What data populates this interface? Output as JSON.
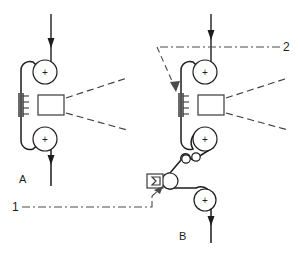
{
  "figure": {
    "width": 300,
    "height": 257,
    "background": "#ffffff",
    "line_color": "#1d1d1d",
    "dash_color": "#4a4a4a",
    "component_color": "#3a3a3a"
  },
  "labels": {
    "station_a": "A",
    "station_b": "B",
    "ref_one": "1",
    "ref_two": "2",
    "roller_mark": "+"
  },
  "stations": [
    {
      "id": "A",
      "label": "A",
      "entry_arrow_direction": "down",
      "exit_arrow_direction": "down",
      "rollers": [
        {
          "name": "upper-driven-roller",
          "mark": "+",
          "cx": 45,
          "cy": 72,
          "r": 12
        },
        {
          "name": "lower-driven-roller",
          "mark": "+",
          "cx": 45,
          "cy": 139,
          "r": 12
        }
      ],
      "treatment_box": {
        "name": "applicator-box",
        "x": 38,
        "y": 95,
        "w": 26,
        "h": 20
      },
      "comb_bar": {
        "name": "corona-comb-bar",
        "x": 19,
        "y": 94,
        "h": 23,
        "ticks": 4
      },
      "spray_lines": 2
    },
    {
      "id": "B",
      "label": "B",
      "entry_arrow_direction": "down",
      "exit_arrow_direction": "down",
      "rollers": [
        {
          "name": "upper-driven-roller",
          "mark": "+",
          "cx": 205,
          "cy": 72,
          "r": 12
        },
        {
          "name": "lower-driven-roller",
          "mark": "+",
          "cx": 205,
          "cy": 139,
          "r": 12
        },
        {
          "name": "nip-roller",
          "mark": "",
          "cx": 170,
          "cy": 181,
          "r": 8
        },
        {
          "name": "exit-driven-roller",
          "mark": "+",
          "cx": 205,
          "cy": 200,
          "r": 11
        }
      ],
      "idlers": [
        {
          "name": "idler-roller-left",
          "cx": 183,
          "cy": 162,
          "r": 4
        },
        {
          "name": "idler-roller-right",
          "cx": 194,
          "cy": 160,
          "r": 4
        }
      ],
      "treatment_box": {
        "name": "applicator-box",
        "x": 198,
        "y": 95,
        "w": 26,
        "h": 20
      },
      "comb_bar": {
        "name": "corona-comb-bar",
        "x": 179,
        "y": 94,
        "h": 23,
        "ticks": 4
      },
      "wedge_box": {
        "name": "doctor-blade-box",
        "x": 146,
        "y": 174,
        "w": 17,
        "h": 14
      },
      "spray_lines": 2
    }
  ],
  "reference_callouts": [
    {
      "id": "1",
      "label": "1",
      "style": "dash-dot-leader",
      "points_to": "nip-between-doctor-box-and-roller",
      "from_x": 14,
      "from_y": 207
    },
    {
      "id": "2",
      "label": "2",
      "style": "dash-dot-leader",
      "points_to": "corona-comb-bar-station-b",
      "from_x": 287,
      "from_y": 47
    }
  ]
}
